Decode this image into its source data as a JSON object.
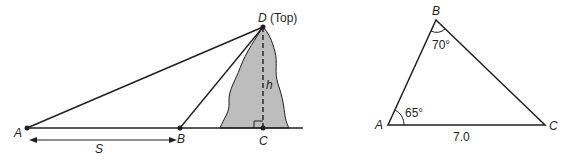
{
  "figure_left": {
    "title": "Height of a mountain from two observation points",
    "points": {
      "A": {
        "label": "A"
      },
      "B": {
        "label": "B"
      },
      "C": {
        "label": "C"
      },
      "D": {
        "label": "D",
        "annotation": "(Top)"
      }
    },
    "distance_label": "S",
    "height_label": "h",
    "colors": {
      "mountain_fill": "#bdbdbd",
      "line": "#231f20"
    }
  },
  "figure_right": {
    "title": "Triangle ABC",
    "vertices": {
      "A": {
        "label": "A"
      },
      "B": {
        "label": "B"
      },
      "C": {
        "label": "C"
      }
    },
    "angle_A": "65°",
    "angle_B": "70°",
    "side_AC": "7.0"
  }
}
